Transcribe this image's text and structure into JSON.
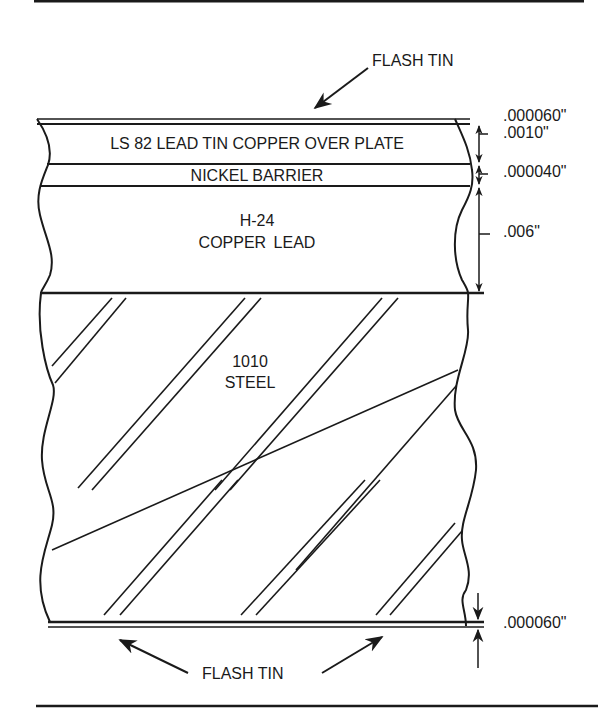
{
  "diagram": {
    "callouts": {
      "top_flash_tin": "FLASH TIN",
      "bottom_flash_tin": "FLASH TIN"
    },
    "layers": [
      {
        "id": "flash-tin-top",
        "label": "",
        "thickness": ".000060\""
      },
      {
        "id": "overplate",
        "label": "LS 82 LEAD TIN COPPER OVER PLATE",
        "thickness": ".0010\""
      },
      {
        "id": "nickel-barrier",
        "label": "NICKEL BARRIER",
        "thickness": ".000040\""
      },
      {
        "id": "copper-lead",
        "label_line1": "H-24",
        "label_line2": "COPPER  LEAD",
        "thickness": ".006\""
      },
      {
        "id": "steel",
        "label_line1": "1010",
        "label_line2": "STEEL",
        "thickness": ""
      },
      {
        "id": "flash-tin-bottom",
        "label": "",
        "thickness": ".000060\""
      }
    ],
    "colors": {
      "ink": "#1a1a1a",
      "background": "#ffffff"
    }
  }
}
